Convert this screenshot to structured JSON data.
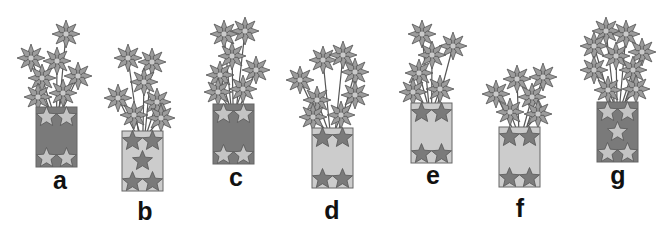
{
  "figure": {
    "colors": {
      "background": "#ffffff",
      "petal": "#9c9c9c",
      "petal_stroke": "#555555",
      "center": "#c9c9c9",
      "stem": "#555555",
      "vase_dark": "#7a7a7a",
      "vase_light": "#cccccc",
      "star_light": "#c4c4c4",
      "star_dark": "#7a7a7a",
      "label": "#111111"
    },
    "vases": [
      {
        "label": "a",
        "vase_style": "dark",
        "star_rows": "top2-bottom2",
        "vase_rect": [
          36,
          107,
          41,
          60
        ],
        "label_pos": [
          60,
          168
        ],
        "flowers": [
          [
            66,
            34
          ],
          [
            31,
            58
          ],
          [
            57,
            61
          ],
          [
            42,
            78
          ],
          [
            78,
            76
          ],
          [
            38,
            97
          ],
          [
            63,
            93
          ]
        ]
      },
      {
        "label": "b",
        "vase_style": "light",
        "star_rows": "top2-mid1-bottom2",
        "vase_rect": [
          122,
          131,
          41,
          60
        ],
        "label_pos": [
          145,
          199
        ],
        "flowers": [
          [
            128,
            58
          ],
          [
            152,
            62
          ],
          [
            144,
            82
          ],
          [
            118,
            98
          ],
          [
            157,
            102
          ],
          [
            134,
            115
          ],
          [
            161,
            118
          ]
        ]
      },
      {
        "label": "c",
        "vase_style": "dark",
        "star_rows": "top2-bottom2",
        "vase_rect": [
          213,
          104,
          41,
          60
        ],
        "label_pos": [
          236,
          165
        ],
        "flowers": [
          [
            224,
            34
          ],
          [
            245,
            31
          ],
          [
            232,
            56
          ],
          [
            220,
            75
          ],
          [
            256,
            70
          ],
          [
            218,
            92
          ],
          [
            243,
            89
          ]
        ]
      },
      {
        "label": "d",
        "vase_style": "light",
        "star_rows": "top2-bottom2",
        "vase_rect": [
          312,
          128,
          41,
          60
        ],
        "label_pos": [
          332,
          198
        ],
        "flowers": [
          [
            323,
            60
          ],
          [
            343,
            55
          ],
          [
            300,
            80
          ],
          [
            355,
            72
          ],
          [
            317,
            100
          ],
          [
            355,
            95
          ],
          [
            313,
            117
          ],
          [
            341,
            115
          ]
        ]
      },
      {
        "label": "e",
        "vase_style": "light",
        "star_rows": "top2-bottom2",
        "vase_rect": [
          411,
          103,
          41,
          60
        ],
        "label_pos": [
          433,
          163
        ],
        "flowers": [
          [
            422,
            34
          ],
          [
            453,
            46
          ],
          [
            432,
            55
          ],
          [
            419,
            73
          ],
          [
            413,
            92
          ],
          [
            440,
            89
          ]
        ]
      },
      {
        "label": "f",
        "vase_style": "light",
        "star_rows": "top2-bottom2",
        "vase_rect": [
          499,
          127,
          41,
          60
        ],
        "label_pos": [
          520,
          196
        ],
        "flowers": [
          [
            517,
            79
          ],
          [
            543,
            77
          ],
          [
            496,
            94
          ],
          [
            532,
            97
          ],
          [
            510,
            112
          ],
          [
            538,
            114
          ]
        ]
      },
      {
        "label": "g",
        "vase_style": "dark",
        "star_rows": "top2-mid1-bottom2",
        "vase_rect": [
          597,
          102,
          41,
          60
        ],
        "label_pos": [
          618,
          163
        ],
        "flowers": [
          [
            606,
            31
          ],
          [
            626,
            34
          ],
          [
            594,
            46
          ],
          [
            616,
            56
          ],
          [
            642,
            52
          ],
          [
            594,
            70
          ],
          [
            633,
            70
          ],
          [
            608,
            90
          ],
          [
            636,
            89
          ]
        ]
      }
    ]
  }
}
